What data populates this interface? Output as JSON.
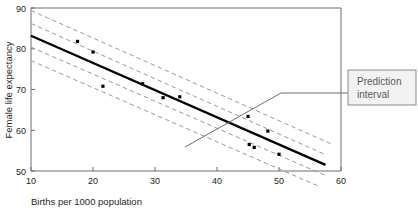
{
  "chart_data": {
    "type": "scatter",
    "title": "",
    "xlabel": "Births per 1000 population",
    "ylabel": "Female life expectancy",
    "xlim": [
      10,
      60
    ],
    "ylim": [
      50,
      90
    ],
    "xticks": [
      10,
      20,
      30,
      40,
      50,
      60
    ],
    "yticks": [
      50,
      60,
      70,
      80,
      90
    ],
    "xtick_labels": [
      "10",
      "20",
      "30",
      "40",
      "50",
      "60"
    ],
    "ytick_labels": [
      "50",
      "60",
      "70",
      "80",
      "90"
    ],
    "grid": false,
    "legend_position": "none",
    "points": [
      {
        "x": 17.5,
        "y": 81.8
      },
      {
        "x": 20.0,
        "y": 79.2
      },
      {
        "x": 21.6,
        "y": 70.8
      },
      {
        "x": 28.0,
        "y": 71.4
      },
      {
        "x": 31.3,
        "y": 68.0
      },
      {
        "x": 34.0,
        "y": 68.2
      },
      {
        "x": 45.0,
        "y": 63.4
      },
      {
        "x": 48.2,
        "y": 59.8
      },
      {
        "x": 45.2,
        "y": 56.5
      },
      {
        "x": 46.0,
        "y": 55.8
      },
      {
        "x": 50.0,
        "y": 54.1
      }
    ],
    "fit_line": {
      "name": "regression line",
      "x": [
        10,
        57.5
      ],
      "y": [
        83.2,
        51.5
      ]
    },
    "series": [
      {
        "name": "confidence interval upper",
        "style": "dashed",
        "x": [
          10,
          57.5
        ],
        "y": [
          86.2,
          54.0
        ]
      },
      {
        "name": "confidence interval lower",
        "style": "dashed",
        "x": [
          10,
          57.5
        ],
        "y": [
          80.4,
          48.9
        ]
      },
      {
        "name": "prediction interval upper",
        "style": "dashed",
        "x": [
          10,
          58.5
        ],
        "y": [
          89.4,
          56.6
        ]
      },
      {
        "name": "prediction interval lower",
        "style": "dashed",
        "x": [
          10,
          56.5
        ],
        "y": [
          77.1,
          46.2
        ]
      }
    ],
    "annotations": [
      {
        "name": "prediction-interval-callout",
        "text_line1": "Prediction",
        "text_line2": "interval",
        "points_to": {
          "x": 36.5,
          "y": 69.0
        }
      }
    ],
    "colors": {
      "fit_line": "#000000",
      "interval_line": "#9a9a9a",
      "point": "#000000",
      "axis": "#6d6e71",
      "callout_fill": "#f2f2f2",
      "callout_border": "#8b8b8b",
      "callout_text": "#58595b"
    }
  }
}
